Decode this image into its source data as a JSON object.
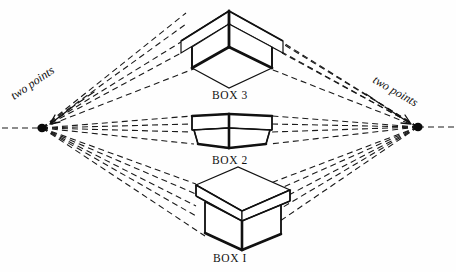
{
  "diagram": {
    "background_color": "#fefefe",
    "ink_color": "#111111",
    "labels": {
      "box_top": "BOX 3",
      "box_middle": "BOX 2",
      "box_bottom": "BOX I",
      "vanishing_point_left": "two points",
      "vanishing_point_right": "two points"
    },
    "geometry": {
      "vp_left": {
        "x": 42,
        "y": 128
      },
      "vp_right": {
        "x": 418,
        "y": 127
      },
      "horizon_y": 128,
      "label_left_rotation_deg": -34,
      "label_right_rotation_deg": 30
    },
    "boxes": [
      {
        "name": "BOX 3",
        "position": "above eye level",
        "label_x": 230,
        "label_y": 98,
        "view": "seen from below, underside visible"
      },
      {
        "name": "BOX 2",
        "position": "at eye level",
        "label_x": 230,
        "label_y": 163,
        "view": "seen edge-on, top and bottom planes invisible"
      },
      {
        "name": "BOX I",
        "position": "below eye level",
        "label_x": 230,
        "label_y": 261,
        "view": "seen from above, lid top visible"
      }
    ],
    "style": {
      "dash_pattern": "6 4",
      "dash_width": 1.1,
      "solid_width": 1.2,
      "heavy_width": 2.6
    }
  }
}
